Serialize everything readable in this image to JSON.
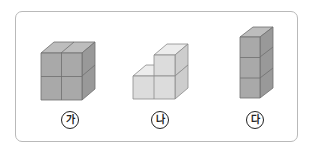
{
  "figures": [
    {
      "id": "ga",
      "label": "가",
      "description": "2x2 stack of cubes (2 wide, 2 high, 1 deep)",
      "cube_count": 4,
      "color_front": "#a9a9a9",
      "color_top": "#bdbdbd",
      "color_side": "#999999"
    },
    {
      "id": "na",
      "label": "나",
      "description": "L-shaped stack: 2 cubes on bottom row, 1 cube on top right",
      "cube_count": 3,
      "color_front": "#dcdcdc",
      "color_top": "#ececec",
      "color_side": "#cdcdcd"
    },
    {
      "id": "da",
      "label": "다",
      "description": "Vertical tower of 3 cubes",
      "cube_count": 3,
      "color_front": "#a9a9a9",
      "color_top": "#bdbdbd",
      "color_side": "#999999"
    }
  ],
  "colors": {
    "frame_border": "#b9b9b9",
    "edge": "#6f6f6f"
  }
}
